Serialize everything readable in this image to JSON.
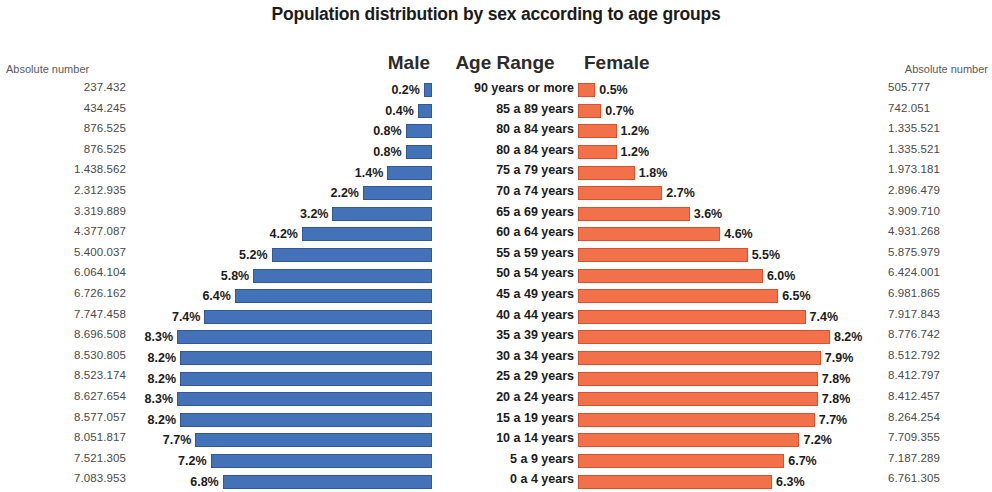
{
  "chart_data": {
    "type": "bar",
    "title": "Population distribution by sex according to age groups",
    "orientation": "horizontal",
    "layout": "population-pyramid",
    "xlabel": "",
    "ylabel": "",
    "grid": false,
    "legend_position": "top",
    "categories": [
      "90 years or more",
      "85 a 89 years",
      "80 a 84 years",
      "80 a 84 years",
      "75 a 79 years",
      "70 a 74 years",
      "65 a 69 years",
      "60 a 64 years",
      "55 a 59 years",
      "50 a 54 years",
      "45 a 49 years",
      "40 a 44 years",
      "35 a 39 years",
      "30 a 34 years",
      "25 a 29 years",
      "20 a 24 years",
      "15 a 19 years",
      "10 a 14 years",
      "5 a 9 years",
      "0 a 4 years"
    ],
    "series": [
      {
        "name": "Male",
        "color": "#4472b8",
        "unit": "%",
        "values": [
          0.2,
          0.4,
          0.8,
          0.8,
          1.4,
          2.2,
          3.2,
          4.2,
          5.2,
          5.8,
          6.4,
          7.4,
          8.3,
          8.2,
          8.2,
          8.3,
          8.2,
          7.7,
          7.2,
          6.8
        ],
        "absolute_numbers": [
          "237.432",
          "434.245",
          "876.525",
          "876.525",
          "1.438.562",
          "2.312.935",
          "3.319.889",
          "4.377.087",
          "5.400.037",
          "6.064.104",
          "6.726.162",
          "7.747.458",
          "8.696.508",
          "8.530.805",
          "8.523.174",
          "8.627.654",
          "8.577.057",
          "8.051.817",
          "7.521.305",
          "7.083.953"
        ]
      },
      {
        "name": "Female",
        "color": "#f2714a",
        "unit": "%",
        "values": [
          0.5,
          0.7,
          1.2,
          1.2,
          1.8,
          2.7,
          3.6,
          4.6,
          5.5,
          6.0,
          6.5,
          7.4,
          8.2,
          7.9,
          7.8,
          7.8,
          7.7,
          7.2,
          6.7,
          6.3
        ],
        "absolute_numbers": [
          "505.777",
          "742.051",
          "1.335.521",
          "1.335.521",
          "1.973.181",
          "2.896.479",
          "3.909.710",
          "4.931.268",
          "5.875.979",
          "6.424.001",
          "6.981.865",
          "7.917.843",
          "8.776.742",
          "8.512.792",
          "8.412.797",
          "8.412.457",
          "8.264.254",
          "7.709.355",
          "7.187.289",
          "6.761.305"
        ]
      }
    ],
    "xlim": [
      0,
      8.6
    ]
  },
  "headers": {
    "absolute_left": "Absolute number",
    "absolute_right": "Absolute number",
    "male": "Male",
    "age_range": "Age Range",
    "female": "Female"
  },
  "rows": [
    {
      "abs_left": "237.432",
      "male_pct": "0.2%",
      "age": "90 years or more",
      "female_pct": "0.5%",
      "abs_right": "505.777",
      "male_value": 0.2,
      "female_value": 0.5
    },
    {
      "abs_left": "434.245",
      "male_pct": "0.4%",
      "age": "85 a 89 years",
      "female_pct": "0.7%",
      "abs_right": "742.051",
      "male_value": 0.4,
      "female_value": 0.7
    },
    {
      "abs_left": "876.525",
      "male_pct": "0.8%",
      "age": "80 a 84 years",
      "female_pct": "1.2%",
      "abs_right": "1.335.521",
      "male_value": 0.8,
      "female_value": 1.2
    },
    {
      "abs_left": "876.525",
      "male_pct": "0.8%",
      "age": "80 a 84 years",
      "female_pct": "1.2%",
      "abs_right": "1.335.521",
      "male_value": 0.8,
      "female_value": 1.2
    },
    {
      "abs_left": "1.438.562",
      "male_pct": "1.4%",
      "age": "75 a 79 years",
      "female_pct": "1.8%",
      "abs_right": "1.973.181",
      "male_value": 1.4,
      "female_value": 1.8
    },
    {
      "abs_left": "2.312.935",
      "male_pct": "2.2%",
      "age": "70 a 74 years",
      "female_pct": "2.7%",
      "abs_right": "2.896.479",
      "male_value": 2.2,
      "female_value": 2.7
    },
    {
      "abs_left": "3.319.889",
      "male_pct": "3.2%",
      "age": "65 a 69 years",
      "female_pct": "3.6%",
      "abs_right": "3.909.710",
      "male_value": 3.2,
      "female_value": 3.6
    },
    {
      "abs_left": "4.377.087",
      "male_pct": "4.2%",
      "age": "60 a 64 years",
      "female_pct": "4.6%",
      "abs_right": "4.931.268",
      "male_value": 4.2,
      "female_value": 4.6
    },
    {
      "abs_left": "5.400.037",
      "male_pct": "5.2%",
      "age": "55 a 59 years",
      "female_pct": "5.5%",
      "abs_right": "5.875.979",
      "male_value": 5.2,
      "female_value": 5.5
    },
    {
      "abs_left": "6.064.104",
      "male_pct": "5.8%",
      "age": "50 a 54 years",
      "female_pct": "6.0%",
      "abs_right": "6.424.001",
      "male_value": 5.8,
      "female_value": 6.0
    },
    {
      "abs_left": "6.726.162",
      "male_pct": "6.4%",
      "age": "45 a 49 years",
      "female_pct": "6.5%",
      "abs_right": "6.981.865",
      "male_value": 6.4,
      "female_value": 6.5
    },
    {
      "abs_left": "7.747.458",
      "male_pct": "7.4%",
      "age": "40 a 44 years",
      "female_pct": "7.4%",
      "abs_right": "7.917.843",
      "male_value": 7.4,
      "female_value": 7.4
    },
    {
      "abs_left": "8.696.508",
      "male_pct": "8.3%",
      "age": "35 a 39 years",
      "female_pct": "8.2%",
      "abs_right": "8.776.742",
      "male_value": 8.3,
      "female_value": 8.2
    },
    {
      "abs_left": "8.530.805",
      "male_pct": "8.2%",
      "age": "30 a 34 years",
      "female_pct": "7.9%",
      "abs_right": "8.512.792",
      "male_value": 8.2,
      "female_value": 7.9
    },
    {
      "abs_left": "8.523.174",
      "male_pct": "8.2%",
      "age": "25 a 29 years",
      "female_pct": "7.8%",
      "abs_right": "8.412.797",
      "male_value": 8.2,
      "female_value": 7.8
    },
    {
      "abs_left": "8.627.654",
      "male_pct": "8.3%",
      "age": "20 a 24 years",
      "female_pct": "7.8%",
      "abs_right": "8.412.457",
      "male_value": 8.3,
      "female_value": 7.8
    },
    {
      "abs_left": "8.577.057",
      "male_pct": "8.2%",
      "age": "15 a 19 years",
      "female_pct": "7.7%",
      "abs_right": "8.264.254",
      "male_value": 8.2,
      "female_value": 7.7
    },
    {
      "abs_left": "8.051.817",
      "male_pct": "7.7%",
      "age": "10 a 14 years",
      "female_pct": "7.2%",
      "abs_right": "7.709.355",
      "male_value": 7.7,
      "female_value": 7.2
    },
    {
      "abs_left": "7.521.305",
      "male_pct": "7.2%",
      "age": "5 a 9 years",
      "female_pct": "6.7%",
      "abs_right": "7.187.289",
      "male_value": 7.2,
      "female_value": 6.7
    },
    {
      "abs_left": "7.083.953",
      "male_pct": "6.8%",
      "age": "0 a 4 years",
      "female_pct": "6.3%",
      "abs_right": "6.761.305",
      "male_value": 6.8,
      "female_value": 6.3
    }
  ],
  "style": {
    "male_color": "#4472b8",
    "female_color": "#f2714a",
    "max_bar_px": 253,
    "max_value": 8.3
  }
}
